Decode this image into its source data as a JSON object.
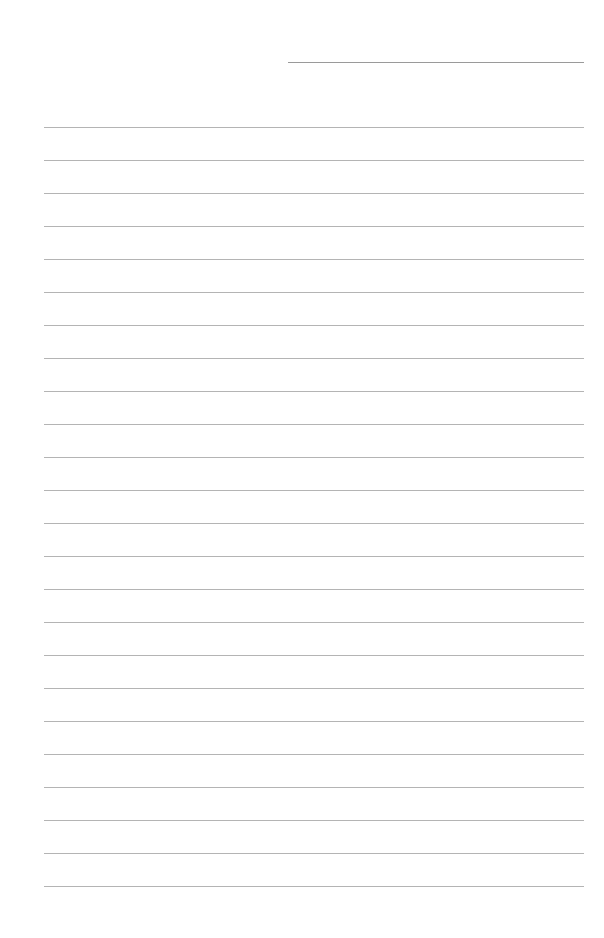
{
  "page": {
    "type": "lined-notebook-page",
    "background": "#ffffff",
    "line_color": "#b4b4b4",
    "title_line": {
      "x": 288,
      "y": 62,
      "width": 296,
      "color": "#9a9a9a"
    },
    "ruled_lines": {
      "count": 24,
      "start_y": 127,
      "spacing": 33,
      "x": 44,
      "width": 540
    }
  }
}
